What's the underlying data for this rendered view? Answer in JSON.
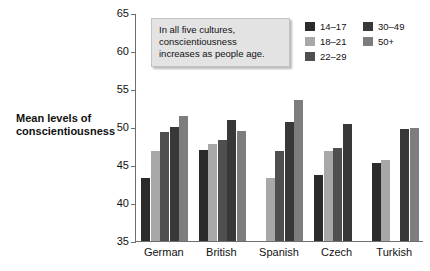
{
  "axis_title": "Mean levels of conscientiousness",
  "annotation": {
    "line1": "In all five cultures,",
    "line2": "conscientiousness",
    "line3": "increases as people age."
  },
  "legend": {
    "left_column": [
      {
        "label": "14–17",
        "color": "#2b2b2b"
      },
      {
        "label": "18–21",
        "color": "#a8a8a8"
      },
      {
        "label": "22–29",
        "color": "#4f4f4f"
      }
    ],
    "right_column": [
      {
        "label": "30–49",
        "color": "#383838"
      },
      {
        "label": "50+",
        "color": "#7d7d7d"
      }
    ]
  },
  "chart_data": {
    "type": "bar",
    "title": "",
    "xlabel": "",
    "ylabel": "Mean levels of conscientiousness",
    "ylim": [
      35,
      65
    ],
    "yticks": [
      35,
      40,
      45,
      50,
      55,
      60,
      65
    ],
    "grid": false,
    "legend_position": "top-right",
    "categories": [
      "German",
      "British",
      "Spanish",
      "Czech",
      "Turkish"
    ],
    "series": [
      {
        "name": "14–17",
        "color": "#2b2b2b",
        "values": [
          43.3,
          47.0,
          null,
          43.7,
          45.3
        ]
      },
      {
        "name": "18–21",
        "color": "#a8a8a8",
        "values": [
          46.9,
          47.7,
          43.3,
          46.9,
          45.7
        ]
      },
      {
        "name": "22–29",
        "color": "#4f4f4f",
        "values": [
          49.3,
          48.3,
          46.9,
          47.3,
          null
        ]
      },
      {
        "name": "30–49",
        "color": "#383838",
        "values": [
          50.0,
          50.9,
          50.7,
          50.4,
          49.7
        ]
      },
      {
        "name": "50+",
        "color": "#7d7d7d",
        "values": [
          51.5,
          49.5,
          53.6,
          null,
          49.9
        ]
      }
    ]
  }
}
